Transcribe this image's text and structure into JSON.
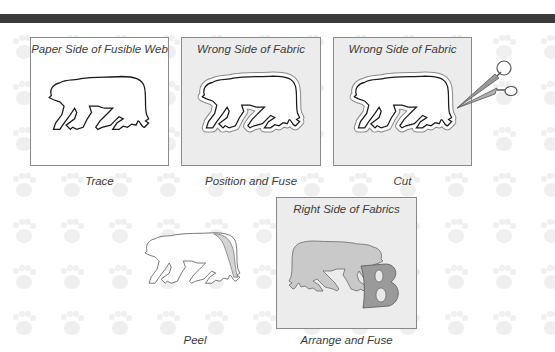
{
  "header": {
    "bar_color": "#3a3a3a"
  },
  "steps": [
    {
      "panel_label": "Paper Side of Fusible Web",
      "caption": "Trace",
      "panel_type": "paper"
    },
    {
      "panel_label": "Wrong Side of Fabric",
      "caption": "Position and Fuse",
      "panel_type": "fabric"
    },
    {
      "panel_label": "Wrong Side of Fabric",
      "caption": "Cut",
      "panel_type": "fabric",
      "tool": "scissors-icon"
    },
    {
      "panel_label": "",
      "caption": "Peel",
      "panel_type": "none"
    },
    {
      "panel_label": "Right Side of Fabrics",
      "caption": "Arrange and Fuse",
      "panel_type": "fabric",
      "applique_letter": "B"
    }
  ],
  "colors": {
    "outline": "#1a1a1a",
    "fabric_bg": "#ececec",
    "panel_border": "#8a8a8a",
    "fused_bear": "#c9c9c9",
    "letter_fill": "#9a9a9a"
  }
}
